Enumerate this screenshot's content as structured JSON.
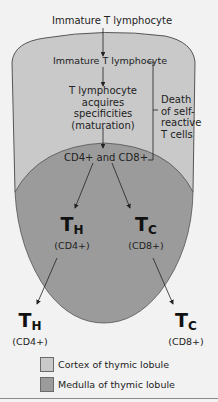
{
  "diagram": {
    "top_label": "Immature T lymphocyte",
    "cortex_label": "Immature T lymphocyte",
    "maturation_label": [
      "T lymphocyte",
      "acquires",
      "specificities",
      "(maturation)"
    ],
    "death_label": [
      "Death",
      "of self-",
      "reactive",
      "T cells"
    ],
    "double_positive_label": "CD4+ and CD8+",
    "medulla_cells": [
      {
        "main": "T",
        "sub": "H",
        "marker": "(CD4+)"
      },
      {
        "main": "T",
        "sub": "C",
        "marker": "(CD8+)"
      }
    ],
    "exit_cells": [
      {
        "main": "T",
        "sub": "H",
        "marker": "(CD4+)"
      },
      {
        "main": "T",
        "sub": "C",
        "marker": "(CD8+)"
      }
    ]
  },
  "legend": {
    "items": [
      {
        "label": "Cortex of thymic lobule",
        "color": "#c9c9c9"
      },
      {
        "label": "Medulla of thymic lobule",
        "color": "#9b9b9b"
      }
    ]
  },
  "colors": {
    "cortex": "#c9c9c9",
    "medulla": "#9b9b9b",
    "background": "#f2f2f2",
    "outline": "#333333"
  }
}
